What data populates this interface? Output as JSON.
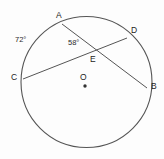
{
  "figure": {
    "background_color": "#fdfdfd",
    "stroke_color": "#555555"
  },
  "circle": {
    "name": "circle-O",
    "center_label": "O",
    "center_x": 86.5,
    "center_y": 82,
    "radius": 65.5
  },
  "points": [
    {
      "id": "A",
      "label": "A",
      "x": 62,
      "y": 24,
      "label_x": 57,
      "label_y": 12
    },
    {
      "id": "D",
      "label": "D",
      "x": 127,
      "y": 38,
      "label_x": 131,
      "label_y": 27
    },
    {
      "id": "C",
      "label": "C",
      "x": 23,
      "y": 79,
      "label_x": 12,
      "label_y": 74
    },
    {
      "id": "B",
      "label": "B",
      "x": 147,
      "y": 88,
      "label_x": 151,
      "label_y": 83
    },
    {
      "id": "E",
      "label": "E",
      "x": 94,
      "y": 53,
      "label_x": 90,
      "label_y": 56
    },
    {
      "id": "O",
      "label": "O",
      "x": 85,
      "y": 86,
      "label_x": 81,
      "label_y": 74
    }
  ],
  "chords": [
    {
      "name": "chord-AB",
      "from": "A",
      "to": "B"
    },
    {
      "name": "chord-CD",
      "from": "C",
      "to": "D"
    }
  ],
  "angles": [
    {
      "name": "angle-arc-AC",
      "value": "72°",
      "label_x": 18,
      "label_y": 38
    },
    {
      "name": "angle-AEC",
      "value": "58°",
      "label_x": 69,
      "label_y": 40
    }
  ]
}
